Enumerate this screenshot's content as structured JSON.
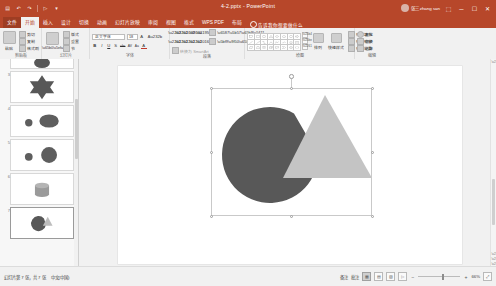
{
  "titlebar": {
    "document_title": "4-2.pptx - PowerPoint",
    "quick_access": [
      {
        "name": "save-icon",
        "glyph": "▤"
      },
      {
        "name": "undo-icon",
        "glyph": "↶"
      },
      {
        "name": "redo-icon",
        "glyph": "↷"
      },
      {
        "name": "start-slideshow-icon",
        "glyph": "▷"
      },
      {
        "name": "customize-qat-icon",
        "glyph": "▾"
      }
    ],
    "account_name": "张三 zhang san",
    "window_controls": [
      {
        "name": "ribbon-display-options-button",
        "glyph": "⬚"
      },
      {
        "name": "minimize-button",
        "glyph": "─"
      },
      {
        "name": "maximize-button",
        "glyph": "☐"
      },
      {
        "name": "close-button",
        "glyph": "✕"
      }
    ]
  },
  "tabs": {
    "file_label": "文件",
    "items": [
      {
        "label": "开始",
        "active": true
      },
      {
        "label": "插入",
        "active": false
      },
      {
        "label": "设计",
        "active": false
      },
      {
        "label": "切换",
        "active": false
      },
      {
        "label": "动画",
        "active": false
      },
      {
        "label": "幻灯片放映",
        "active": false
      },
      {
        "label": "审阅",
        "active": false
      },
      {
        "label": "视图",
        "active": false
      },
      {
        "label": "格式",
        "active": false
      },
      {
        "label": "WPS PDF",
        "active": false
      },
      {
        "label": "布局",
        "active": false
      }
    ],
    "tellme": "告诉我你想要做什么"
  },
  "ribbon": {
    "groups": [
      {
        "name": "clipboard",
        "label": "剪贴板",
        "big_button": {
          "label": "粘贴",
          "icon": "paste-icon"
        },
        "small_buttons": [
          {
            "label": "剪切",
            "icon": "cut-icon"
          },
          {
            "label": "复制",
            "icon": "copy-icon"
          },
          {
            "label": "格式刷",
            "icon": "format-painter-icon"
          }
        ]
      },
      {
        "name": "slides",
        "label": "幻灯片",
        "big_button": {
          "label": "新建\n幻灯片",
          "icon": "new-slide-icon"
        },
        "small_buttons": [
          {
            "label": "版式",
            "icon": "layout-icon"
          },
          {
            "label": "重置",
            "icon": "reset-icon"
          },
          {
            "label": "节",
            "icon": "section-icon"
          }
        ]
      },
      {
        "name": "font",
        "label": "字体",
        "font_name": "正文字体",
        "font_size": "18",
        "buttons": [
          {
            "label": "B",
            "icon": "bold-icon"
          },
          {
            "label": "I",
            "icon": "italic-icon"
          },
          {
            "label": "U",
            "icon": "underline-icon"
          },
          {
            "label": "S",
            "icon": "shadow-icon"
          },
          {
            "label": "abc",
            "icon": "strikethrough-icon"
          },
          {
            "label": "AV",
            "icon": "character-spacing-icon"
          },
          {
            "label": "Aa",
            "icon": "change-case-icon"
          },
          {
            "label": "A",
            "icon": "font-color-icon"
          }
        ]
      },
      {
        "name": "paragraph",
        "label": "段落",
        "buttons": [
          {
            "label": "",
            "icon": "bullets-icon"
          },
          {
            "label": "",
            "icon": "numbering-icon"
          },
          {
            "label": "",
            "icon": "decrease-indent-icon"
          },
          {
            "label": "",
            "icon": "increase-indent-icon"
          },
          {
            "label": "",
            "icon": "align-left-icon"
          },
          {
            "label": "",
            "icon": "align-center-icon"
          },
          {
            "label": "",
            "icon": "align-right-icon"
          },
          {
            "label": "",
            "icon": "columns-icon"
          },
          {
            "label": "",
            "icon": "text-direction-icon"
          },
          {
            "label": "",
            "icon": "align-text-icon"
          },
          {
            "label": "转换为 SmartArt",
            "icon": "smartart-icon"
          }
        ]
      },
      {
        "name": "drawing",
        "label": "绘图",
        "shape_rows": [
          [
            "rect",
            "rounded-rect",
            "oval",
            "triangle",
            "diamond",
            "pentagon",
            "hexagon",
            "arrow-right"
          ],
          [
            "line",
            "line-arrow",
            "elbow",
            "curve",
            "freeform",
            "scribble",
            "star",
            "banner"
          ],
          [
            "parallelogram",
            "trapezoid",
            "cylinder",
            "cube",
            "callout",
            "chevron",
            "plus",
            "bracket"
          ]
        ],
        "buttons": [
          {
            "label": "排列",
            "icon": "arrange-icon"
          },
          {
            "label": "快速样式",
            "icon": "quick-styles-icon"
          },
          {
            "label": "形状填充",
            "icon": "shape-fill-icon"
          },
          {
            "label": "形状轮廓",
            "icon": "shape-outline-icon"
          },
          {
            "label": "形状效果",
            "icon": "shape-effects-icon"
          }
        ]
      },
      {
        "name": "editing",
        "label": "编辑",
        "buttons": [
          {
            "label": "查找",
            "icon": "find-icon"
          },
          {
            "label": "替换",
            "icon": "replace-icon"
          },
          {
            "label": "选择",
            "icon": "select-icon"
          }
        ]
      }
    ]
  },
  "thumbnails": {
    "slides": [
      {
        "number": "2",
        "name": "slide-thumb-2",
        "selected": false,
        "shapes": [
          {
            "type": "oval",
            "color": "#585858"
          }
        ]
      },
      {
        "number": "3",
        "name": "slide-thumb-3",
        "selected": false,
        "shapes": [
          {
            "type": "star6",
            "color": "#585858"
          }
        ]
      },
      {
        "number": "4",
        "name": "slide-thumb-4",
        "selected": false,
        "shapes": [
          {
            "type": "circle-small",
            "color": "#5e5e5e"
          },
          {
            "type": "oval-large",
            "color": "#5e5e5e"
          }
        ]
      },
      {
        "number": "5",
        "name": "slide-thumb-5",
        "selected": false,
        "shapes": [
          {
            "type": "circle-small",
            "color": "#5e5e5e"
          },
          {
            "type": "circle-large",
            "color": "#5e5e5e"
          }
        ]
      },
      {
        "number": "6",
        "name": "slide-thumb-6",
        "selected": false,
        "shapes": [
          {
            "type": "cylinder",
            "color": "#8c8c8c"
          }
        ]
      },
      {
        "number": "7",
        "name": "slide-thumb-7",
        "selected": true,
        "shapes": [
          {
            "type": "pie",
            "color": "#585858"
          },
          {
            "type": "triangle",
            "color": "#b8b8b8"
          }
        ]
      }
    ]
  },
  "slide": {
    "shapes": [
      {
        "name": "pie-shape",
        "type": "pie",
        "fill": "#585858",
        "cx": 270,
        "cy": 155,
        "r": 48,
        "notch_start_deg": 0,
        "notch_end_deg": 60
      },
      {
        "name": "triangle-shape",
        "type": "triangle",
        "fill": "#c4c4c4",
        "apex_x": 325,
        "apex_y": 95,
        "left_x": 283,
        "right_x": 372,
        "base_y": 178
      }
    ],
    "selection": {
      "name": "selection-bounding-box",
      "left": 211,
      "top": 88,
      "width": 161,
      "height": 128,
      "handle_count": 8,
      "rotation_handle": true
    }
  },
  "status": {
    "slide_counter": "幻灯片第 7 张，共 7 张",
    "language": "中文(中国)",
    "notes_label": "备注",
    "comments_label": "批注",
    "view_buttons": [
      {
        "name": "normal-view-button",
        "glyph": "▦",
        "active": true
      },
      {
        "name": "slide-sorter-button",
        "glyph": "▤",
        "active": false
      },
      {
        "name": "reading-view-button",
        "glyph": "▧",
        "active": false
      },
      {
        "name": "slideshow-button",
        "glyph": "▷",
        "active": false
      }
    ],
    "zoom_out": "−",
    "zoom_in": "+",
    "zoom_level": "66%",
    "fit_button": {
      "name": "fit-slide-button",
      "glyph": "⤢"
    }
  },
  "colors": {
    "brand": "#b7472a",
    "ribbon_bg": "#f1f1f1",
    "pie_fill": "#585858",
    "triangle_fill": "#c4c4c4"
  }
}
